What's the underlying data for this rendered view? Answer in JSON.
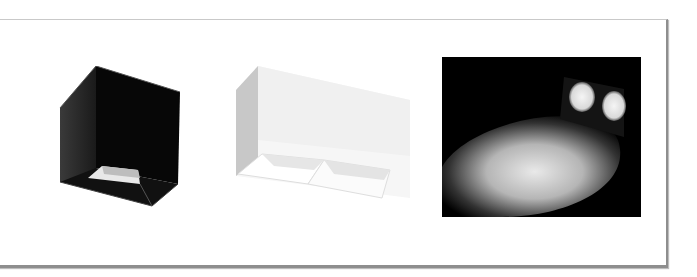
{
  "panel": {
    "products": [
      {
        "name": "black-square-surface-downlight",
        "color": "#0a0a0a"
      },
      {
        "name": "white-double-surface-downlight",
        "color": "#f2f2f2"
      }
    ],
    "photo": {
      "name": "light-beam-photo",
      "background": "#000000"
    }
  }
}
